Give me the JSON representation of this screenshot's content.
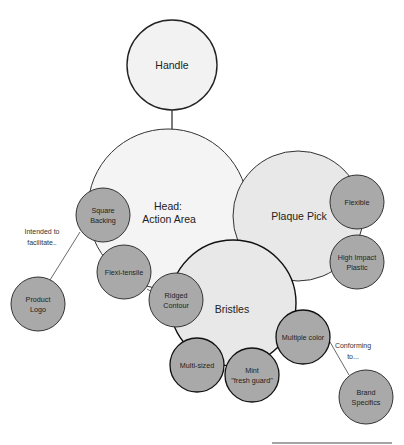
{
  "diagram": {
    "colors": {
      "primary_fill": "#f2f2f2",
      "secondary_fill": "#e6e6e6",
      "detail_fill": "#a9a9a9",
      "stroke": "#222222"
    },
    "nodes": {
      "handle": {
        "label": "Handle"
      },
      "head": {
        "line1": "Head:",
        "line2": "Action Area"
      },
      "plaque_pick": {
        "label": "Plaque Pick"
      },
      "bristles": {
        "label": "Bristles"
      },
      "square_backing": {
        "line1": "Square",
        "line2": "Backing"
      },
      "flexi_tensile": {
        "label": "Flexi-tensile"
      },
      "ridged_contour": {
        "line1": "Ridged",
        "line2": "Contour"
      },
      "product_logo": {
        "line1": "Product",
        "line2": "Logo"
      },
      "flexible": {
        "label": "Flexible"
      },
      "high_impact_plastic": {
        "line1": "High Impact",
        "line2": "Plastic"
      },
      "multiple_color": {
        "label": "Multiple color"
      },
      "multi_sized": {
        "label": "Multi-sized"
      },
      "mint": {
        "line1": "Mint",
        "line2": "\"fresh guard\""
      },
      "brand_specifics": {
        "line1": "Brand",
        "line2": "Specifics"
      }
    },
    "annotations": {
      "intended": {
        "line1": "Intended to",
        "line2": "facilitate.."
      },
      "conforming": {
        "line1": "Conforming",
        "line2": "to..."
      }
    }
  }
}
